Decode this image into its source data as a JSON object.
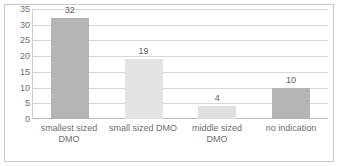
{
  "chart_data": {
    "type": "bar",
    "title": "",
    "subtitle": "",
    "xlabel": "",
    "ylabel": "",
    "categories": [
      "smallest sized DMO",
      "small sized DMO",
      "middle sized DMO",
      "no indication"
    ],
    "values": [
      32,
      19,
      4,
      10
    ],
    "data_labels": [
      "32",
      "19",
      "4",
      "10"
    ],
    "ylim": [
      0,
      35
    ],
    "y_ticks": [
      0,
      5,
      10,
      15,
      20,
      25,
      30,
      35
    ],
    "y_tick_labels": [
      "0",
      "5",
      "10",
      "15",
      "20",
      "25",
      "30",
      "35"
    ],
    "grid": true,
    "grid_axis": "y",
    "legend": false,
    "legend_position": "none",
    "bar_colors": [
      "#b4b4b4",
      "#e3e3e3",
      "#e0e0e0",
      "#b4b4b4"
    ],
    "colors": {
      "gridline": "#d7d7d7",
      "axis": "#bdbdbd",
      "tick_text": "#6d6d6d",
      "label_text": "#5e5e5e",
      "frame": "#c9c9c9",
      "background": "#ffffff"
    }
  }
}
